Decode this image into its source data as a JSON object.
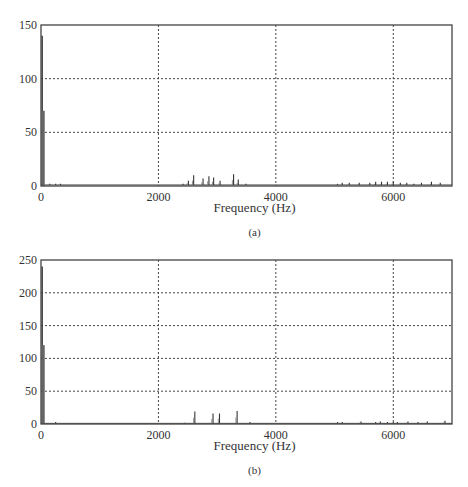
{
  "chart_data": [
    {
      "type": "line",
      "panel": "(a)",
      "title": "",
      "xlabel": "Frequency (Hz)",
      "ylabel": "",
      "xlim": [
        0,
        7000
      ],
      "ylim": [
        0,
        150
      ],
      "xticks": [
        "0",
        "2000",
        "4000",
        "6000"
      ],
      "yticks": [
        "0",
        "50",
        "100",
        "150"
      ],
      "grid": true,
      "peaks": [
        {
          "x": 20,
          "y": 140
        },
        {
          "x": 40,
          "y": 70
        },
        {
          "x": 60,
          "y": 70
        },
        {
          "x": 150,
          "y": 2
        },
        {
          "x": 250,
          "y": 2
        },
        {
          "x": 330,
          "y": 2
        },
        {
          "x": 2420,
          "y": 2
        },
        {
          "x": 2510,
          "y": 5
        },
        {
          "x": 2600,
          "y": 10
        },
        {
          "x": 2760,
          "y": 7
        },
        {
          "x": 2860,
          "y": 9
        },
        {
          "x": 2940,
          "y": 8
        },
        {
          "x": 3050,
          "y": 5
        },
        {
          "x": 3280,
          "y": 11
        },
        {
          "x": 3360,
          "y": 6
        },
        {
          "x": 3490,
          "y": 2
        },
        {
          "x": 5050,
          "y": 2
        },
        {
          "x": 5130,
          "y": 3
        },
        {
          "x": 5250,
          "y": 3
        },
        {
          "x": 5420,
          "y": 3
        },
        {
          "x": 5600,
          "y": 3
        },
        {
          "x": 5700,
          "y": 4
        },
        {
          "x": 5800,
          "y": 4
        },
        {
          "x": 5900,
          "y": 4
        },
        {
          "x": 6000,
          "y": 4
        },
        {
          "x": 6120,
          "y": 3
        },
        {
          "x": 6230,
          "y": 3
        },
        {
          "x": 6350,
          "y": 2
        },
        {
          "x": 6480,
          "y": 3
        },
        {
          "x": 6650,
          "y": 4
        },
        {
          "x": 6800,
          "y": 3
        }
      ],
      "caption": "(a)"
    },
    {
      "type": "line",
      "panel": "(b)",
      "title": "",
      "xlabel": "Frequency (Hz)",
      "ylabel": "",
      "xlim": [
        0,
        7000
      ],
      "ylim": [
        0,
        250
      ],
      "xticks": [
        "0",
        "2000",
        "4000",
        "6000"
      ],
      "yticks": [
        "0",
        "50",
        "100",
        "150",
        "200",
        "250"
      ],
      "grid": true,
      "peaks": [
        {
          "x": 20,
          "y": 240
        },
        {
          "x": 40,
          "y": 120
        },
        {
          "x": 60,
          "y": 120
        },
        {
          "x": 250,
          "y": 3
        },
        {
          "x": 2450,
          "y": 2
        },
        {
          "x": 2620,
          "y": 19
        },
        {
          "x": 2930,
          "y": 16
        },
        {
          "x": 3040,
          "y": 16
        },
        {
          "x": 3340,
          "y": 20
        },
        {
          "x": 3560,
          "y": 3
        },
        {
          "x": 5050,
          "y": 3
        },
        {
          "x": 5130,
          "y": 3
        },
        {
          "x": 5450,
          "y": 4
        },
        {
          "x": 5700,
          "y": 3
        },
        {
          "x": 5780,
          "y": 4
        },
        {
          "x": 5900,
          "y": 3
        },
        {
          "x": 6000,
          "y": 3
        },
        {
          "x": 6070,
          "y": 3
        },
        {
          "x": 6250,
          "y": 4
        },
        {
          "x": 6420,
          "y": 3
        },
        {
          "x": 6580,
          "y": 4
        },
        {
          "x": 6880,
          "y": 5
        }
      ],
      "caption": "(b)"
    }
  ]
}
